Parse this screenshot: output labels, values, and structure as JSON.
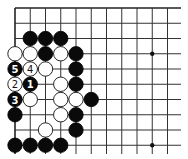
{
  "board": {
    "origin_x": 15,
    "origin_y": 8,
    "spacing": 15.25,
    "columns": 11,
    "rows": 10,
    "right_extent": 181,
    "bottom_extent": 154,
    "edges": [
      "top",
      "left"
    ],
    "star_points": [
      {
        "col": 9,
        "row": 3
      },
      {
        "col": 9,
        "row": 9
      }
    ],
    "colors": {
      "black_stone": "#0a0a0a",
      "white_stone": "#ffffff",
      "line": "#333333",
      "background": "#ffffff"
    }
  },
  "stones": [
    {
      "col": 1,
      "row": 2,
      "color": "black"
    },
    {
      "col": 2,
      "row": 2,
      "color": "black"
    },
    {
      "col": 3,
      "row": 2,
      "color": "black"
    },
    {
      "col": 0,
      "row": 3,
      "color": "white"
    },
    {
      "col": 1,
      "row": 3,
      "color": "white"
    },
    {
      "col": 2,
      "row": 3,
      "color": "black"
    },
    {
      "col": 3,
      "row": 3,
      "color": "white"
    },
    {
      "col": 4,
      "row": 3,
      "color": "black"
    },
    {
      "col": 0,
      "row": 4,
      "color": "black",
      "label": "5"
    },
    {
      "col": 1,
      "row": 4,
      "color": "white",
      "label": "4"
    },
    {
      "col": 2,
      "row": 4,
      "color": "white"
    },
    {
      "col": 4,
      "row": 4,
      "color": "black"
    },
    {
      "col": 0,
      "row": 5,
      "color": "white",
      "label": "2"
    },
    {
      "col": 1,
      "row": 5,
      "color": "black",
      "label": "1"
    },
    {
      "col": 3,
      "row": 5,
      "color": "white"
    },
    {
      "col": 4,
      "row": 5,
      "color": "black"
    },
    {
      "col": 0,
      "row": 6,
      "color": "black",
      "label": "3"
    },
    {
      "col": 1,
      "row": 6,
      "color": "white"
    },
    {
      "col": 3,
      "row": 6,
      "color": "white"
    },
    {
      "col": 4,
      "row": 6,
      "color": "white"
    },
    {
      "col": 5,
      "row": 6,
      "color": "black"
    },
    {
      "col": 0,
      "row": 7,
      "color": "black"
    },
    {
      "col": 3,
      "row": 7,
      "color": "white"
    },
    {
      "col": 4,
      "row": 7,
      "color": "black"
    },
    {
      "col": 2,
      "row": 8,
      "color": "white"
    },
    {
      "col": 4,
      "row": 8,
      "color": "black"
    },
    {
      "col": 0,
      "row": 9,
      "color": "black"
    },
    {
      "col": 1,
      "row": 9,
      "color": "black"
    },
    {
      "col": 2,
      "row": 9,
      "color": "black"
    },
    {
      "col": 3,
      "row": 9,
      "color": "black"
    }
  ],
  "move_sequence": [
    {
      "move": "1",
      "color": "black",
      "col": 1,
      "row": 5
    },
    {
      "move": "2",
      "color": "white",
      "col": 0,
      "row": 5
    },
    {
      "move": "3",
      "color": "black",
      "col": 0,
      "row": 6
    },
    {
      "move": "4",
      "color": "white",
      "col": 1,
      "row": 4
    },
    {
      "move": "5",
      "color": "black",
      "col": 0,
      "row": 4
    }
  ]
}
